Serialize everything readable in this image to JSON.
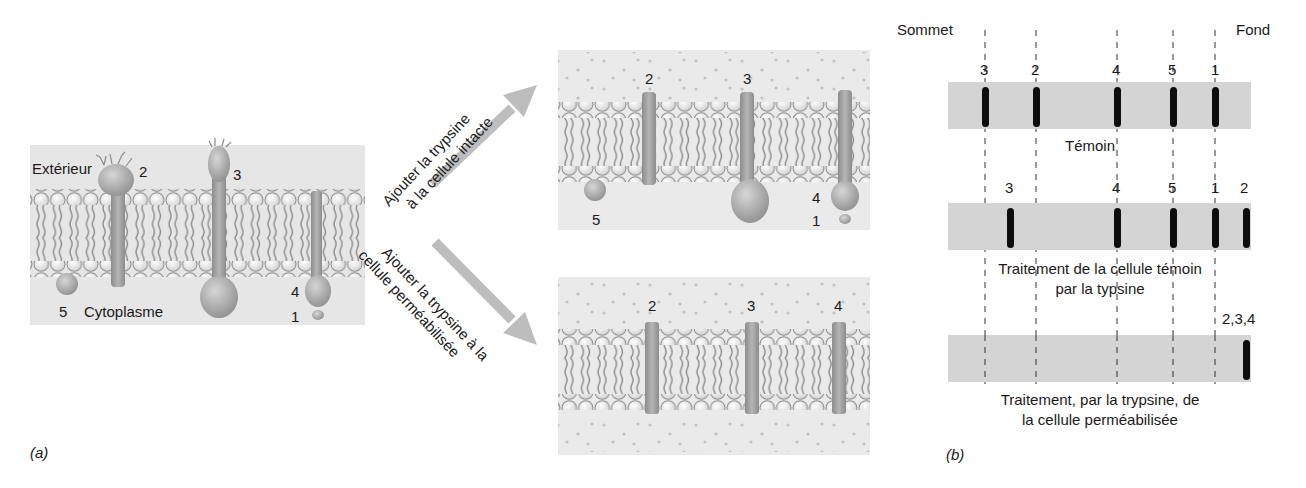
{
  "panel_a": {
    "label": "(a)",
    "exterior_label": "Extérieur",
    "cytoplasm_label": "Cytoplasme",
    "proteins": [
      {
        "id": "2",
        "label": "2"
      },
      {
        "id": "3",
        "label": "3"
      },
      {
        "id": "4",
        "label": "4"
      },
      {
        "id": "1",
        "label": "1"
      },
      {
        "id": "5",
        "label": "5"
      }
    ],
    "arrow_up": {
      "line1": "Ajouter la trypsine",
      "line2": "à la cellule intacte"
    },
    "arrow_down": {
      "line1": "Ajouter la trypsine à la",
      "line2": "cellule perméabilisée"
    },
    "intact_result": {
      "labels": [
        "2",
        "3",
        "4",
        "1",
        "5"
      ]
    },
    "permeabilized_result": {
      "labels": [
        "2",
        "3",
        "4"
      ]
    }
  },
  "panel_b": {
    "label": "(b)",
    "top_label": "Sommet",
    "bottom_label": "Fond",
    "gels": [
      {
        "caption_line1": "Témoin",
        "caption_line2": "",
        "bands": [
          "3",
          "2",
          "4",
          "5",
          "1"
        ]
      },
      {
        "caption_line1": "Traitement de la cellule témoin",
        "caption_line2": "par la typsine",
        "bands": [
          "3",
          "4",
          "5",
          "1",
          "2"
        ]
      },
      {
        "caption_line1": "Traitement, par la trypsine, de",
        "caption_line2": "la cellule perméabilisée",
        "bands": [
          "2,3,4"
        ]
      }
    ]
  },
  "colors": {
    "panel_bg": "#e6e6e6",
    "gel_bg": "#d4d4d4",
    "band": "#0d0d0d",
    "arrow": "#bdbdbd",
    "protein": "#a8a8a8",
    "lipid_tail": "#8a8a8a"
  }
}
